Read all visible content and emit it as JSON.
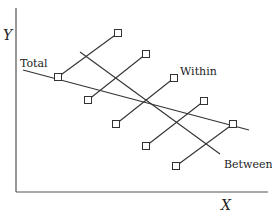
{
  "diagram": {
    "type": "regression-decomposition",
    "axes": {
      "x_label": "X",
      "y_label": "Y"
    },
    "line_labels": {
      "total": "Total",
      "within": "Within",
      "between": "Between"
    },
    "colors": {
      "ink": "#333333",
      "axis": "#555555",
      "background": "#ffffff"
    },
    "points": [
      {
        "id": "g1-low",
        "x": 58,
        "y": 77
      },
      {
        "id": "g1-high",
        "x": 118,
        "y": 33
      },
      {
        "id": "g2-low",
        "x": 88,
        "y": 100
      },
      {
        "id": "g2-high",
        "x": 146,
        "y": 54
      },
      {
        "id": "g3-low",
        "x": 116,
        "y": 124
      },
      {
        "id": "g3-high",
        "x": 174,
        "y": 78
      },
      {
        "id": "g4-low",
        "x": 146,
        "y": 146
      },
      {
        "id": "g4-high",
        "x": 204,
        "y": 101
      },
      {
        "id": "g5-low",
        "x": 176,
        "y": 166
      },
      {
        "id": "g5-high",
        "x": 233,
        "y": 124
      }
    ],
    "within_lines": [
      {
        "x1": 58,
        "y1": 77,
        "x2": 118,
        "y2": 33
      },
      {
        "x1": 88,
        "y1": 100,
        "x2": 146,
        "y2": 54
      },
      {
        "x1": 116,
        "y1": 124,
        "x2": 174,
        "y2": 78
      },
      {
        "x1": 146,
        "y1": 146,
        "x2": 204,
        "y2": 101
      },
      {
        "x1": 176,
        "y1": 166,
        "x2": 233,
        "y2": 124
      }
    ],
    "total_line": {
      "x1": 23,
      "y1": 70,
      "x2": 249,
      "y2": 130
    },
    "between_line": {
      "x1": 80,
      "y1": 52,
      "x2": 220,
      "y2": 154
    }
  }
}
